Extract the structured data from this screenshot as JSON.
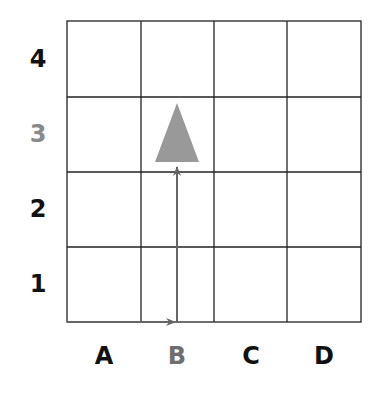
{
  "diagram": {
    "grid": {
      "columns": 4,
      "rows": 4,
      "line_color": "#222222"
    },
    "row_labels": [
      {
        "text": "4",
        "color": "#111111"
      },
      {
        "text": "3",
        "color": "#8a8a8a"
      },
      {
        "text": "2",
        "color": "#111111"
      },
      {
        "text": "1",
        "color": "#111111"
      }
    ],
    "column_labels": [
      {
        "text": "A",
        "color": "#111111"
      },
      {
        "text": "B",
        "color": "#6e6e6e"
      },
      {
        "text": "C",
        "color": "#111111"
      },
      {
        "text": "D",
        "color": "#111111"
      }
    ],
    "marker": {
      "shape": "triangle",
      "cell": "B3",
      "color": "#999999"
    },
    "path": {
      "color": "#666666",
      "description": "Arrow from origin right to B, then up to B3"
    }
  }
}
